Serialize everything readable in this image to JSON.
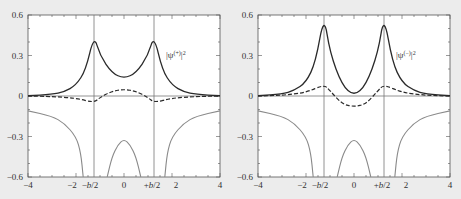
{
  "figure": {
    "background": "#ececec",
    "plot_background": "#ffffff",
    "colors": {
      "solid_density": "#2a2a2a",
      "dashed_curve": "#2a2a2a",
      "potential": "#8a8a8a",
      "axes": "#555555",
      "vertical_lines": "#777777"
    }
  },
  "chart_data": [
    {
      "type": "line",
      "panel": "left",
      "legend_label": "|ψ(+)|²",
      "legend_text": "|ψ",
      "legend_sup": "(+)",
      "legend_tail": "|²",
      "xlim": [
        -4,
        4
      ],
      "ylim": [
        -0.6,
        0.6
      ],
      "x_ticks": [
        "-4",
        "-2",
        "-b/2",
        "0",
        "+b/2",
        "2",
        "4"
      ],
      "x_tick_values": [
        -4,
        -2,
        -1.25,
        0,
        1.25,
        2,
        4
      ],
      "y_ticks": [
        "0.6",
        "0.3",
        "0",
        "-0.3",
        "-0.6"
      ],
      "y_tick_values": [
        0.6,
        0.3,
        0,
        -0.3,
        -0.6
      ],
      "vertical_lines_at": [
        -1.25,
        1.25
      ],
      "grid": false,
      "series": [
        {
          "name": "|ψ(+)|² (solid)",
          "style": "solid",
          "x": [
            -4,
            -3,
            -2.5,
            -2,
            -1.6,
            -1.25,
            -1,
            -0.5,
            0,
            0.5,
            1,
            1.25,
            1.6,
            2,
            2.5,
            3,
            4
          ],
          "y": [
            0.002,
            0.012,
            0.03,
            0.08,
            0.19,
            0.45,
            0.3,
            0.17,
            0.13,
            0.17,
            0.3,
            0.45,
            0.19,
            0.08,
            0.03,
            0.012,
            0.002
          ]
        },
        {
          "name": "dashed",
          "style": "dashed",
          "x": [
            -4,
            -3,
            -2,
            -1.25,
            -1,
            -0.5,
            0,
            0.5,
            1,
            1.25,
            2,
            3,
            4
          ],
          "y": [
            0,
            -0.004,
            -0.015,
            -0.05,
            -0.01,
            0.035,
            0.05,
            0.035,
            -0.01,
            -0.05,
            -0.015,
            -0.004,
            0
          ]
        },
        {
          "name": "potential (gray)",
          "style": "solid-gray",
          "x": [
            -4,
            -3,
            -2.5,
            -2,
            -1.8,
            -1.7,
            -0.7,
            -0.5,
            -0.25,
            0,
            0.25,
            0.5,
            0.7,
            1.7,
            1.8,
            2,
            2.5,
            3,
            4
          ],
          "y": [
            -0.11,
            -0.15,
            -0.2,
            -0.3,
            -0.42,
            -0.6,
            -0.6,
            -0.45,
            -0.36,
            -0.32,
            -0.36,
            -0.45,
            -0.6,
            -0.6,
            -0.42,
            -0.3,
            -0.2,
            -0.15,
            -0.11
          ]
        }
      ]
    },
    {
      "type": "line",
      "panel": "right",
      "legend_label": "|ψ(−)|²",
      "legend_text": "|ψ",
      "legend_sup": "(−)",
      "legend_tail": "|²",
      "xlim": [
        -4,
        4
      ],
      "ylim": [
        -0.6,
        0.6
      ],
      "x_ticks": [
        "-4",
        "-2",
        "-b/2",
        "0",
        "+b/2",
        "2",
        "4"
      ],
      "x_tick_values": [
        -4,
        -2,
        -1.25,
        0,
        1.25,
        2,
        4
      ],
      "y_ticks": [
        "0.6",
        "0.3",
        "0",
        "-0.3",
        "-0.6"
      ],
      "y_tick_values": [
        0.6,
        0.3,
        0,
        -0.3,
        -0.6
      ],
      "vertical_lines_at": [
        -1.25,
        1.25
      ],
      "grid": false,
      "series": [
        {
          "name": "|ψ(−)|² (solid)",
          "style": "solid",
          "x": [
            -4,
            -3,
            -2.5,
            -2,
            -1.6,
            -1.25,
            -1,
            -0.5,
            0,
            0.5,
            1,
            1.25,
            1.6,
            2,
            2.5,
            3,
            4
          ],
          "y": [
            0.002,
            0.015,
            0.04,
            0.1,
            0.25,
            0.6,
            0.32,
            0.08,
            0.0,
            0.08,
            0.32,
            0.6,
            0.25,
            0.1,
            0.04,
            0.015,
            0.002
          ]
        },
        {
          "name": "dashed",
          "style": "dashed",
          "x": [
            -4,
            -3,
            -2,
            -1.25,
            -1,
            -0.5,
            0,
            0.5,
            1,
            1.25,
            2,
            3,
            4
          ],
          "y": [
            0,
            0.005,
            0.025,
            0.085,
            0.04,
            -0.06,
            -0.08,
            -0.06,
            0.04,
            0.085,
            0.025,
            0.005,
            0
          ]
        },
        {
          "name": "potential (gray)",
          "style": "solid-gray",
          "x": [
            -4,
            -3,
            -2.5,
            -2,
            -1.8,
            -1.7,
            -0.7,
            -0.5,
            -0.25,
            0,
            0.25,
            0.5,
            0.7,
            1.7,
            1.8,
            2,
            2.5,
            3,
            4
          ],
          "y": [
            -0.11,
            -0.15,
            -0.2,
            -0.3,
            -0.42,
            -0.6,
            -0.6,
            -0.45,
            -0.36,
            -0.32,
            -0.36,
            -0.45,
            -0.6,
            -0.6,
            -0.42,
            -0.3,
            -0.2,
            -0.15,
            -0.11
          ]
        }
      ]
    }
  ]
}
